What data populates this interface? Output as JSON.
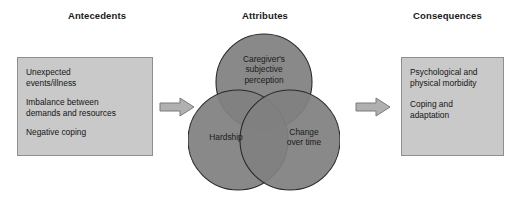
{
  "diagram": {
    "title_bar": {
      "antecedents": "Antecedents",
      "attributes": "Attributes",
      "consequences": "Consequences"
    },
    "colors": {
      "box_fill": "#c9c9c9",
      "box_border": "#8e8e8e",
      "circle_fill": "#808080",
      "circle_stroke": "#2a2a2a",
      "arrow_fill": "#b0b0b0",
      "arrow_stroke": "#7a7a7a",
      "text": "#1a1a1a"
    },
    "antecedents_box": {
      "items": [
        "Unexpected\nevents/illness",
        "Imbalance between\ndemands and resources",
        "Negative coping"
      ]
    },
    "attributes_venn": {
      "type": "venn",
      "circles": [
        {
          "id": "top",
          "label": "Caregiver's\nsubjective\nperception"
        },
        {
          "id": "left",
          "label": "Hardship"
        },
        {
          "id": "right",
          "label": "Change\nover time"
        }
      ]
    },
    "consequences_box": {
      "items": [
        "Psychological and\nphysical morbidity",
        "Coping and\nadaptation"
      ]
    },
    "arrows": [
      {
        "id": "antecedents-to-attributes",
        "direction": "right"
      },
      {
        "id": "attributes-to-consequences",
        "direction": "right"
      }
    ]
  }
}
